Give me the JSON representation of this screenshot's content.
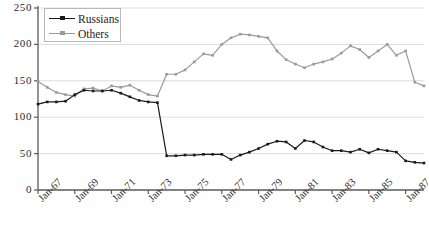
{
  "chart_data": {
    "type": "line",
    "title": "",
    "subtitle": "",
    "xlabel": "",
    "ylabel": "",
    "ylim": [
      0,
      250
    ],
    "yticks": [
      0,
      50,
      100,
      150,
      200,
      250
    ],
    "ytick_labels": [
      "0",
      "50",
      "100",
      "150",
      "200",
      "250"
    ],
    "grid": "horizontal",
    "legend_position": "top-left",
    "x": [
      "Jan-67",
      "Jul-67",
      "Jan-68",
      "Jul-68",
      "Jan-69",
      "Jul-69",
      "Jan-70",
      "Jul-70",
      "Jan-71",
      "Jul-71",
      "Jan-72",
      "Jul-72",
      "Jan-73",
      "Jul-73",
      "Jan-74",
      "Jul-74",
      "Jan-75",
      "Jul-75",
      "Jan-76",
      "Jul-76",
      "Jan-77",
      "Jul-77",
      "Jan-78",
      "Jul-78",
      "Jan-79",
      "Jul-79",
      "Jan-80",
      "Jul-80",
      "Jan-81",
      "Jul-81",
      "Jan-82",
      "Jul-82",
      "Jan-83",
      "Jul-83",
      "Jan-84",
      "Jul-84",
      "Jan-85",
      "Jul-85",
      "Jan-86",
      "Jul-86",
      "Jan-87",
      "Jul-87",
      "Jan-88"
    ],
    "xtick_labels": [
      "Jan-67",
      "Jan-69",
      "Jan-71",
      "Jan-73",
      "Jan-75",
      "Jan-77",
      "Jan-79",
      "Jan-81",
      "Jan-83",
      "Jan-85",
      "Jan-87"
    ],
    "series": [
      {
        "name": "Russians",
        "color": "#1a1a1a",
        "marker": "square",
        "values": [
          118,
          121,
          121,
          122,
          131,
          137,
          136,
          136,
          137,
          133,
          128,
          123,
          121,
          120,
          47,
          47,
          48,
          48,
          49,
          49,
          49,
          42,
          48,
          52,
          57,
          63,
          67,
          66,
          57,
          68,
          66,
          59,
          54,
          54,
          52,
          56,
          51,
          56,
          54,
          52,
          40,
          38,
          37
        ]
      },
      {
        "name": "Others",
        "color": "#9a9a9a",
        "marker": "square",
        "values": [
          149,
          141,
          134,
          131,
          129,
          139,
          140,
          136,
          143,
          141,
          144,
          137,
          131,
          129,
          159,
          159,
          165,
          176,
          187,
          185,
          200,
          209,
          214,
          213,
          211,
          209,
          191,
          179,
          173,
          168,
          173,
          176,
          180,
          188,
          198,
          193,
          182,
          191,
          200,
          185,
          191,
          148,
          143
        ]
      }
    ]
  },
  "legend": {
    "items": [
      {
        "label": "Russians"
      },
      {
        "label": "Others"
      }
    ]
  },
  "colors": {
    "russians": "#1a1a1a",
    "others": "#9a9a9a",
    "axis": "#5a5a5a",
    "grid": "#dcdcdc",
    "text": "#2b2b2b"
  }
}
